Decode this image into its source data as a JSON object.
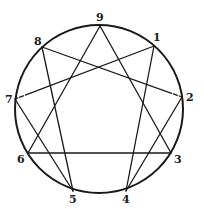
{
  "diagram": {
    "circle": {
      "cx": 99,
      "cy": 109,
      "r": 84
    },
    "points": [
      {
        "id": "9",
        "label": "9",
        "x": 100,
        "y": 26,
        "lx": 96,
        "ly": 21
      },
      {
        "id": "1",
        "label": "1",
        "x": 154,
        "y": 46,
        "lx": 153,
        "ly": 41
      },
      {
        "id": "2",
        "label": "2",
        "x": 182,
        "y": 97,
        "lx": 186,
        "ly": 101
      },
      {
        "id": "3",
        "label": "3",
        "x": 171,
        "y": 153,
        "lx": 174,
        "ly": 163
      },
      {
        "id": "4",
        "label": "4",
        "x": 126,
        "y": 191,
        "lx": 122,
        "ly": 203
      },
      {
        "id": "5",
        "label": "5",
        "x": 73,
        "y": 191,
        "lx": 69,
        "ly": 203
      },
      {
        "id": "6",
        "label": "6",
        "x": 28,
        "y": 153,
        "lx": 17,
        "ly": 163
      },
      {
        "id": "7",
        "label": "7",
        "x": 15,
        "y": 99,
        "lx": 5,
        "ly": 103
      },
      {
        "id": "8",
        "label": "8",
        "x": 42,
        "y": 47,
        "lx": 34,
        "ly": 45
      }
    ],
    "lines": [
      {
        "from": "9",
        "to": "3"
      },
      {
        "from": "3",
        "to": "6"
      },
      {
        "from": "6",
        "to": "9"
      },
      {
        "from": "1",
        "to": "4"
      },
      {
        "from": "4",
        "to": "2"
      },
      {
        "from": "2",
        "to": "8",
        "dashed_near": "2"
      },
      {
        "from": "8",
        "to": "5"
      },
      {
        "from": "5",
        "to": "7"
      },
      {
        "from": "7",
        "to": "1",
        "dashed_near": "7"
      }
    ]
  }
}
